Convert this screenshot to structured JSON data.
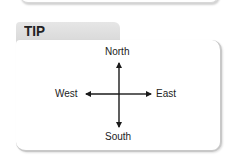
{
  "tip": {
    "label": "TIP"
  },
  "compass": {
    "north": "North",
    "south": "South",
    "east": "East",
    "west": "West"
  },
  "colors": {
    "tab_bg": "#dcdcdc",
    "text": "#222222",
    "arrow": "#1a1a1a"
  }
}
